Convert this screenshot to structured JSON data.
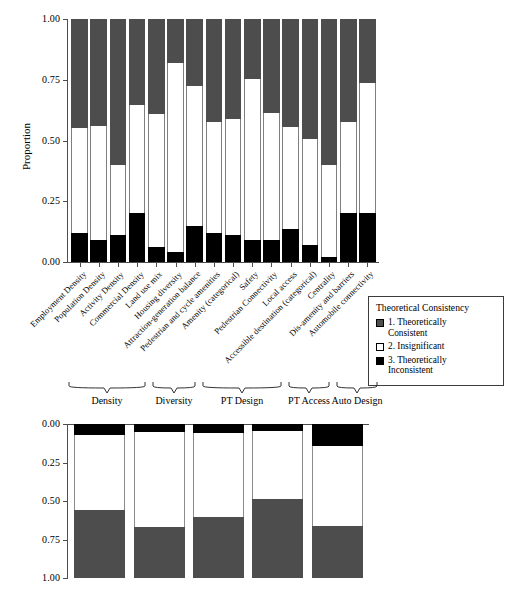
{
  "chart_data": [
    {
      "type": "bar",
      "id": "top-panel",
      "orientation": "vertical-stacked",
      "title": "",
      "xlabel": "",
      "ylabel": "Proportion",
      "ylim": [
        0,
        1
      ],
      "yticks": [
        "0.00",
        "0.25",
        "0.50",
        "0.75",
        "1.00"
      ],
      "grid": false,
      "stacked": true,
      "legend": {
        "title": "Theoretical Consistency",
        "position": "right",
        "entries": [
          {
            "label_line1": "1. Theoretically",
            "label_line2": "Consistent",
            "color": "#4d4d4d"
          },
          {
            "label_line1": "2. Insignificant",
            "label_line2": "",
            "color": "#ffffff"
          },
          {
            "label_line1": "3. Theoretically",
            "label_line2": "Inconsistent",
            "color": "#000000"
          }
        ]
      },
      "categories": [
        "Employment Density",
        "Population Density",
        "Activity Density",
        "Commercial Density",
        "Land use mix",
        "Housing diversity",
        "Attraction-generation balance",
        "Pedestrian and cycle amenities",
        "Amenity (categorical)",
        "Safety",
        "Pedestrian Connectivity",
        "Local access",
        "Accessible destination (categorical)",
        "Centrality",
        "Dis-amenity and barriers",
        "Automobile connectivity"
      ],
      "series": [
        {
          "name": "3. Theoretically Inconsistent",
          "color": "#000000",
          "values": [
            0.12,
            0.09,
            0.11,
            0.2,
            0.06,
            0.04,
            0.15,
            0.12,
            0.11,
            0.09,
            0.09,
            0.135,
            0.07,
            0.02,
            0.2,
            0.2
          ]
        },
        {
          "name": "2. Insignificant",
          "color": "#ffffff",
          "values": [
            0.43,
            0.47,
            0.29,
            0.445,
            0.55,
            0.78,
            0.575,
            0.455,
            0.48,
            0.665,
            0.525,
            0.42,
            0.435,
            0.38,
            0.375,
            0.535
          ]
        },
        {
          "name": "1. Theoretically Consistent",
          "color": "#4d4d4d",
          "values": [
            0.45,
            0.44,
            0.6,
            0.355,
            0.39,
            0.18,
            0.275,
            0.425,
            0.41,
            0.245,
            0.385,
            0.445,
            0.495,
            0.6,
            0.425,
            0.265
          ]
        }
      ]
    },
    {
      "type": "bar",
      "id": "bottom-panel",
      "orientation": "vertical-stacked",
      "title": "",
      "xlabel": "",
      "ylabel": "",
      "ylim": [
        0,
        1
      ],
      "y_axis_inverted": true,
      "yticks": [
        "0.00",
        "0.25",
        "0.50",
        "0.75",
        "1.00"
      ],
      "grid": false,
      "stacked": true,
      "categories": [
        "Density",
        "Diversity",
        "PT Design",
        "PT Access",
        "Auto Design"
      ],
      "series": [
        {
          "name": "3. Theoretically Inconsistent",
          "color": "#000000",
          "values": [
            0.07,
            0.055,
            0.06,
            0.045,
            0.145
          ]
        },
        {
          "name": "2. Insignificant",
          "color": "#ffffff",
          "values": [
            0.49,
            0.615,
            0.545,
            0.445,
            0.52
          ]
        },
        {
          "name": "1. Theoretically Consistent",
          "color": "#4d4d4d",
          "values": [
            0.44,
            0.33,
            0.395,
            0.51,
            0.335
          ]
        }
      ]
    }
  ],
  "top": {
    "ylabel": "Proportion",
    "yticks": [
      "1.00",
      "0.75",
      "0.50",
      "0.25",
      "0.00"
    ],
    "categories": [
      "Employment Density",
      "Population Density",
      "Activity Density",
      "Commercial Density",
      "Land use mix",
      "Housing diversity",
      "Attraction-generation balance",
      "Pedestrian and cycle amenities",
      "Amenity (categorical)",
      "Safety",
      "Pedestrian Connectivity",
      "Local access",
      "Accessible destination (categorical)",
      "Centrality",
      "Dis-amenity and barriers",
      "Automobile connectivity"
    ]
  },
  "legend": {
    "title": "Theoretical Consistency",
    "items": [
      {
        "line1": "1. Theoretically",
        "line2": "Consistent"
      },
      {
        "line1": "2. Insignificant",
        "line2": ""
      },
      {
        "line1": "3. Theoretically",
        "line2": "Inconsistent"
      }
    ]
  },
  "groups": {
    "labels": [
      "Density",
      "Diversity",
      "PT Design",
      "PT Access",
      "Auto Design"
    ]
  },
  "bottom": {
    "yticks": [
      "0.00",
      "0.25",
      "0.50",
      "0.75",
      "1.00"
    ],
    "categories": [
      "Density",
      "Diversity",
      "PT Design",
      "PT Access",
      "Auto Design"
    ]
  },
  "colors": {
    "consistent": "#4d4d4d",
    "insignificant": "#ffffff",
    "inconsistent": "#000000",
    "axis": "#4d4d4d"
  }
}
